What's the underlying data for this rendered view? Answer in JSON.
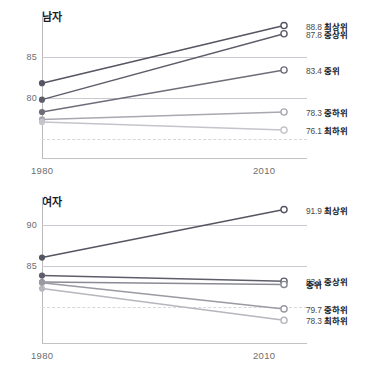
{
  "chart_data": [
    {
      "type": "line",
      "title": "남자",
      "x": [
        1980,
        2010
      ],
      "xlabel": "",
      "ylabel": "",
      "ylim": [
        73.2,
        90.2
      ],
      "yticks": [
        85,
        80
      ],
      "gridlines": [
        85,
        80,
        75
      ],
      "dashed_gridlines": [
        75
      ],
      "xtick_labels": [
        "1980",
        "2010"
      ],
      "legend_position": "right",
      "series": [
        {
          "name": "최상위",
          "values": [
            81.8,
            88.8
          ],
          "end_label": "88.8",
          "color": "#565663"
        },
        {
          "name": "중상위",
          "values": [
            79.8,
            87.8
          ],
          "end_label": "87.8",
          "color": "#5e5e6b"
        },
        {
          "name": "중위",
          "values": [
            78.3,
            83.4
          ],
          "end_label": "83.4",
          "color": "#6e6e7a"
        },
        {
          "name": "중하위",
          "values": [
            77.4,
            78.3
          ],
          "end_label": "78.3",
          "color": "#a8a8b0"
        },
        {
          "name": "최하위",
          "values": [
            77.1,
            76.1
          ],
          "end_label": "76.1",
          "color": "#c4c4cb"
        }
      ]
    },
    {
      "type": "line",
      "title": "여자",
      "x": [
        1980,
        2010
      ],
      "xlabel": "",
      "ylabel": "",
      "ylim": [
        76.0,
        93.2
      ],
      "yticks": [
        90,
        85
      ],
      "gridlines": [
        90,
        85,
        79.9
      ],
      "dashed_gridlines": [
        79.9
      ],
      "xtick_labels": [
        "1980",
        "2010"
      ],
      "legend_position": "right",
      "series": [
        {
          "name": "최상위",
          "values": [
            86.0,
            91.9
          ],
          "end_label": "91.9",
          "color": "#565663"
        },
        {
          "name": "중상위",
          "values": [
            83.8,
            83.1
          ],
          "end_label": "83.1",
          "color": "#5e5e6b"
        },
        {
          "name": "중위",
          "values": [
            83.0,
            82.7
          ],
          "end_label": "",
          "color": "#8a8a94"
        },
        {
          "name": "중하위",
          "values": [
            82.9,
            79.7
          ],
          "end_label": "79.7",
          "color": "#9a9aa3"
        },
        {
          "name": "최하위",
          "values": [
            82.2,
            78.3
          ],
          "end_label": "78.3",
          "color": "#b6b6bd"
        }
      ]
    }
  ]
}
